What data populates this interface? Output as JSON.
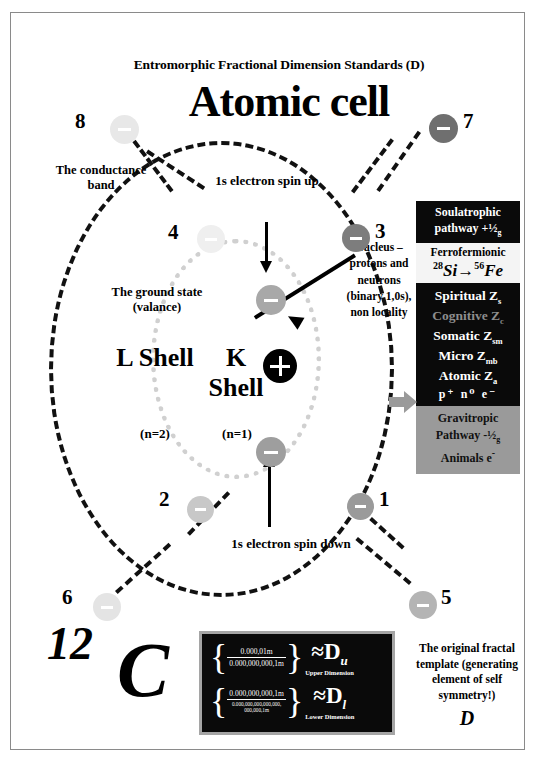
{
  "document": {
    "title": "Entromorphic Fractional Dimension Standards (D)",
    "heading": "Atomic cell"
  },
  "labels": {
    "conductance_band": "The conductance band",
    "ground_state": "The ground state (valance)",
    "l_shell": "L Shell",
    "l_shell_n": "(n=2)",
    "k_shell": "K Shell",
    "k_shell_n": "(n=1)",
    "spin_up": "1s electron spin up",
    "spin_down": "1s electron spin down",
    "nucleus": "Nucleus – protons and neutrons (binary 1,0s), non locality",
    "fractal_template": "The original fractal template (generating element of self symmetry!)",
    "fractal_D": "D"
  },
  "carbon": {
    "mass_number": "12",
    "symbol": "C"
  },
  "electrons": [
    {
      "id": "1",
      "number": "1",
      "color": "#9a9a9a",
      "x": 336,
      "y": 480,
      "size": 27,
      "num_x": 368,
      "num_y": 474
    },
    {
      "id": "2",
      "number": "2",
      "color": "#c8c8c8",
      "x": 176,
      "y": 483,
      "size": 27,
      "num_x": 148,
      "num_y": 474
    },
    {
      "id": "3",
      "number": "3",
      "color": "#7d7d7d",
      "x": 331,
      "y": 211,
      "size": 28,
      "num_x": 364,
      "num_y": 206
    },
    {
      "id": "4",
      "number": "4",
      "color": "#efefef",
      "x": 186,
      "y": 212,
      "size": 28,
      "num_x": 157,
      "num_y": 207
    },
    {
      "id": "5",
      "number": "5",
      "color": "#b4b4b4",
      "x": 398,
      "y": 578,
      "size": 28,
      "num_x": 430,
      "num_y": 572
    },
    {
      "id": "6",
      "number": "6",
      "color": "#e4e4e4",
      "x": 82,
      "y": 580,
      "size": 28,
      "num_x": 51,
      "num_y": 572
    },
    {
      "id": "7",
      "number": "7",
      "color": "#6f6f6f",
      "x": 418,
      "y": 101,
      "size": 29,
      "num_x": 452,
      "num_y": 96
    },
    {
      "id": "8",
      "number": "8",
      "color": "#e8e8e8",
      "x": 99,
      "y": 102,
      "size": 29,
      "num_x": 64,
      "num_y": 96
    }
  ],
  "inner_electrons": [
    {
      "id": "spin-up-electron",
      "color": "#a8a8a8",
      "x": 245,
      "y": 272,
      "size": 30
    },
    {
      "id": "spin-down-electron",
      "color": "#9e9e9e",
      "x": 245,
      "y": 424,
      "size": 30
    }
  ],
  "nucleus_particle": {
    "charge": "+",
    "color": "#000000",
    "x": 252,
    "y": 336,
    "size": 34
  },
  "right_panel": {
    "soulatrophic": {
      "line1": "Soulatrophic",
      "line2": "pathway +½",
      "sub": "g",
      "bg": "#0a0a0a",
      "fg": "#ffffff"
    },
    "ferrofermionic": {
      "title": "Ferrofermionic",
      "from_mass": "28",
      "from_symbol": "Si",
      "to_mass": "56",
      "to_symbol": "Fe",
      "bg": "#f4f4f4"
    },
    "z_levels": {
      "bg": "#0a0a0a",
      "items": [
        {
          "name": "Spiritual",
          "symbol": "Z",
          "sub": "s",
          "color": "#ffffff"
        },
        {
          "name": "Cognitive",
          "symbol": "Z",
          "sub": "c",
          "color": "#8d8d8d"
        },
        {
          "name": "Somatic",
          "symbol": "Z",
          "sub": "sm",
          "color": "#ffffff"
        },
        {
          "name": "Micro",
          "symbol": "Z",
          "sub": "mb",
          "color": "#ffffff"
        },
        {
          "name": "Atomic",
          "symbol": "Z",
          "sub": "a",
          "color": "#ffffff"
        }
      ],
      "particles": "p⁺  n⁰  e⁻"
    },
    "gravitropic": {
      "line1": "Gravitropic",
      "line2": "Pathway -½",
      "sub": "g",
      "line3": "Animals e",
      "line3_sup": "-",
      "bg": "#9a9a9a"
    }
  },
  "fractal_box": {
    "upper": {
      "numerator": "0.000,01m",
      "denominator": "0.000,000,000,1m",
      "approx": "≈D",
      "sub": "u",
      "caption": "Upper Dimension"
    },
    "lower": {
      "numerator": "0.000,000,000,1m",
      "denominator_line1": "0.000,000,000,000,000,",
      "denominator_line2": "000,000,1m",
      "approx": "≈D",
      "sub": "l",
      "caption": "Lower Dimension"
    }
  }
}
